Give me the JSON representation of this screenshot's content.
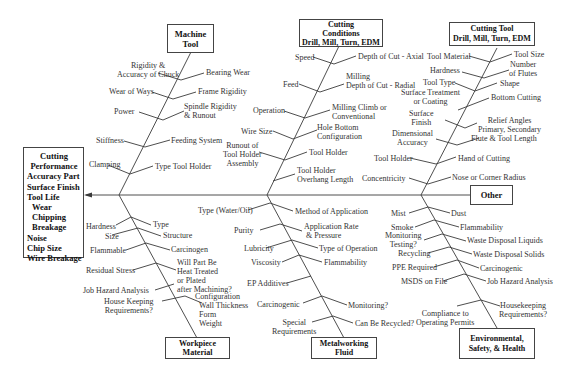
{
  "effect": {
    "title_lines": [
      "Cutting",
      "Performance"
    ],
    "items": [
      "Accuracy Part",
      "Surface Finish",
      "Tool Life",
      "Wear",
      "Chipping",
      "Breakage",
      "Noise",
      "Chip Size",
      "Wire Breakage"
    ]
  },
  "categories": {
    "machine_tool": {
      "title_lines": [
        "Machine",
        "Tool"
      ],
      "causes": [
        "Rigidity &",
        "Accuracy of Chuck",
        "Bearing Wear",
        "Wear of Ways",
        "Frame Rigidity",
        "Power",
        "Spindle Rigidity",
        "& Runout",
        "Stiffness",
        "Feeding System",
        "Clamping",
        "Type Tool Holder"
      ]
    },
    "cutting_conditions": {
      "title_lines": [
        "Cutting",
        "Conditions",
        "Drill, Mill, Turn, EDM"
      ],
      "causes": [
        "Speed",
        "Depth of Cut - Axial",
        "Feed",
        "Milling",
        "Depth of Cut - Radial",
        "Operation",
        "Milling Climb or",
        "Conventional",
        "Wire Size",
        "Hole Bottom",
        "Configuration",
        "Runout of",
        "Tool Holder",
        "Assembly",
        "Tool Holder",
        "Tool Holder",
        "Overhang Length"
      ]
    },
    "cutting_tool": {
      "title_lines": [
        "Cutting Tool",
        "Drill, Mill, Turn, EDM"
      ],
      "causes": [
        "Tool Material",
        "Tool Size",
        "Hardness",
        "Number",
        "of Flutes",
        "Tool Type",
        "Shape",
        "Surface Treatment",
        "or Coating",
        "Bottom Cutting",
        "Surface",
        "Finish",
        "Relief Angles",
        "Primary, Secondary",
        "Dimensional",
        "Accuracy",
        "Flute & Tool Length",
        "Tool Holder",
        "Hand of Cutting",
        "Concentricity",
        "Nose or Corner Radius"
      ]
    },
    "other": {
      "title_lines": [
        "Other"
      ]
    },
    "workpiece_material": {
      "title_lines": [
        "Workpiece",
        "Material"
      ],
      "causes": [
        "Hardness",
        "Type",
        "Size",
        "Structure",
        "Flammable",
        "Carcinogen",
        "Residual Stress",
        "Will Part Be",
        "Heat Treated",
        "or Plated",
        "after Machining?",
        "Job Hazard Analysis",
        "House Keeping",
        "Requirements?",
        "Configuration",
        "Wall Thickness",
        "Form",
        "Weight"
      ]
    },
    "metalworking_fluid": {
      "title_lines": [
        "Metalworking",
        "Fluid"
      ],
      "causes": [
        "Type (Water/Oil)",
        "Method of Application",
        "Purity",
        "Application  Rate",
        "& Pressure",
        "Lubricity",
        "Type of Operation",
        "Viscosity",
        "Flammability",
        "EP Additives",
        "Carcinogenic",
        "Monitoring?",
        "Special",
        "Requirements",
        "Can Be Recycled?"
      ]
    },
    "environmental": {
      "title_lines": [
        "Environmental,",
        "Safety, & Health"
      ],
      "causes": [
        "Mist",
        "Dust",
        "Smoke",
        "Flammability",
        "Monitoring",
        "Testing?",
        "Waste Disposal Liquids",
        "Recycling",
        "Waste Disposal Solids",
        "PPE Required",
        "Carcinogenic",
        "MSDS on File",
        "Job Hazard Analysis",
        "Compliance to",
        "Operating Permits",
        "Housekeeping",
        "Requirements?"
      ]
    }
  },
  "colors": {
    "line": "#3a3a3a",
    "text": "#333333",
    "box_border": "#444444",
    "background": "#ffffff"
  }
}
